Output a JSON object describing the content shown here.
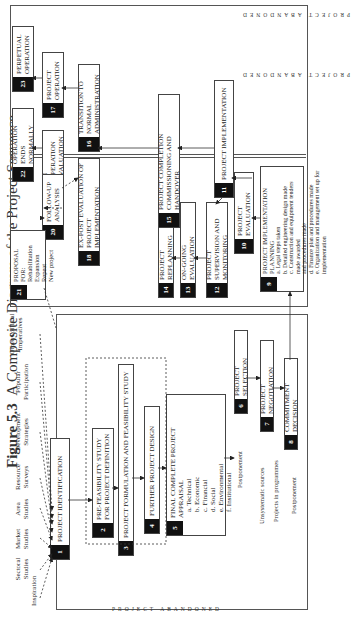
{
  "figure": {
    "label": "Figure 5.3",
    "title": "A Composite Diagram of the Project Sequence"
  },
  "sources": [
    {
      "label": "Inspiration"
    },
    {
      "label": "Sectoral\nStudies"
    },
    {
      "label": "Market\nStudies"
    },
    {
      "label": "Area\nStudies"
    },
    {
      "label": "Resource\nSurveys"
    },
    {
      "label": "Development\nStrategies"
    },
    {
      "label": "Popular\nParticipation"
    },
    {
      "label": "Other Political\nImperatives"
    }
  ],
  "abandoned_label": "PROJECT ABANDONED",
  "stages": {
    "s1": {
      "num": "1",
      "label": "PROJECT IDENTIFICATION"
    },
    "s2": {
      "num": "2",
      "label": "PRE-FEASIBILITY STUDY FOR PROJECT DEFINITION"
    },
    "s3": {
      "num": "3",
      "label": "PROJECT FORMULATION AND FEASIBILITY STUDY"
    },
    "s4": {
      "num": "4",
      "label": "FURTHER PROJECT DESIGN"
    },
    "s5": {
      "num": "5",
      "label": "FINAL COMPLETE PROJECT APPRAISAL",
      "items": [
        "a. Technical",
        "b. Economic",
        "c. Financial",
        "d. Social",
        "e. Environmental",
        "f. Institutional"
      ]
    },
    "s6": {
      "num": "6",
      "label": "PROJECT SELECTION"
    },
    "s7": {
      "num": "7",
      "label": "PROJECT NEGOTIATION"
    },
    "s8": {
      "num": "8",
      "label": "COMMITMENT DECISION"
    },
    "s9": {
      "num": "9",
      "label": "PROJECT IMPLEMENTATION PLANNING",
      "items": [
        "a. Legal steps taken",
        "b. Detailed engineering design made",
        "c. Construction and equipment tenders made awarded",
        "   and procedures made",
        "d. Finance plan and procedures made",
        "e. Organization and management set up for implementation"
      ]
    },
    "s10": {
      "num": "10",
      "label": "PROJECT EVALUATION"
    },
    "s11": {
      "num": "11",
      "label": "PROJECT IMPLEMENTATION"
    },
    "s12": {
      "num": "12",
      "label": "PROJECT SUPERVISION AND MONITORING"
    },
    "s13": {
      "num": "13",
      "label": "ON-GOING EVALUATION"
    },
    "s14": {
      "num": "14",
      "label": "PROJECT REPLANNING"
    },
    "s15": {
      "num": "15",
      "label": "PROJECT COMPLETION COMMISSIONING AND HANDOVER"
    },
    "s16": {
      "num": "16",
      "label": "TRANSITION TO NORMAL ADMINISTRATION"
    },
    "s17": {
      "num": "17",
      "label": "PROJECT OPERATION"
    },
    "s18": {
      "num": "18",
      "label": "EX-POST EVALUATION OF PROJECT IMPLEMENTATION"
    },
    "s19": {
      "num": "19",
      "label": "IN OPERATION EVALUATION"
    },
    "s20": {
      "num": "20",
      "label": "FOLLOW-UP ANALYSIS"
    },
    "s21": {
      "num": "21",
      "label": "PROPOSAL FOR:",
      "items": [
        "Rehabilitation",
        "Expansion",
        "Repeat",
        "New project"
      ]
    },
    "s22": {
      "num": "22",
      "label": "OPERATION ENDS NORMALLY"
    },
    "s23": {
      "num": "23",
      "label": "PERPETUAL OPERATION"
    }
  },
  "annotations": {
    "postponement_5": "Postponement",
    "unsystematic": "Unsystematic sources",
    "programmes": "Projects in programmes",
    "postponement_7": "Postponement"
  }
}
